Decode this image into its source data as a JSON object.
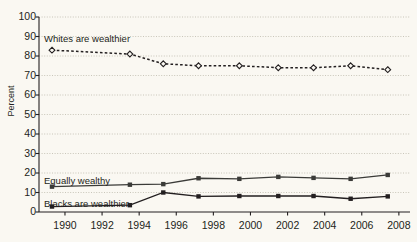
{
  "chart_data": {
    "type": "line",
    "title": "",
    "xlabel": "",
    "ylabel": "Percent",
    "xlim": [
      1988.6,
      2008.6
    ],
    "ylim": [
      0,
      100
    ],
    "grid": true,
    "legend_position": "inline-annotations",
    "yticks": [
      0,
      10,
      20,
      30,
      40,
      50,
      60,
      70,
      80,
      90,
      100
    ],
    "xticks": [
      1990,
      1992,
      1994,
      1996,
      1998,
      2000,
      2002,
      2004,
      2006,
      2008
    ],
    "ytick_labels": [
      "0",
      "10",
      "20",
      "30",
      "40",
      "50",
      "60",
      "70",
      "80",
      "90",
      "100"
    ],
    "xtick_labels": [
      "1990",
      "1992",
      "1994",
      "1996",
      "1998",
      "2000",
      "2002",
      "2004",
      "2006",
      "2008"
    ],
    "series": [
      {
        "name": "Whites are wealthier",
        "marker": "open-diamond",
        "linestyle": "dashed",
        "color": "#231f20",
        "x": [
          1989.3,
          1993.5,
          1995.3,
          1997.2,
          1999.4,
          2001.5,
          2003.4,
          2005.4,
          2007.4
        ],
        "values": [
          83,
          81,
          76,
          75,
          75,
          74,
          74,
          75,
          73
        ]
      },
      {
        "name": "Equally wealthy",
        "marker": "filled-square",
        "linestyle": "solid",
        "color": "#3b3b38",
        "x": [
          1989.3,
          1993.5,
          1995.3,
          1997.2,
          1999.4,
          2001.5,
          2003.4,
          2005.4,
          2007.4
        ],
        "values": [
          13,
          14,
          14.3,
          17.3,
          17,
          18,
          17.5,
          17,
          19
        ]
      },
      {
        "name": "Blacks are wealthier",
        "marker": "filled-square",
        "linestyle": "solid",
        "color": "#231f20",
        "x": [
          1989.3,
          1993.5,
          1995.3,
          1997.2,
          1999.4,
          2001.5,
          2003.4,
          2005.4,
          2007.4
        ],
        "values": [
          2.8,
          3.5,
          10,
          8,
          8.2,
          8.2,
          8.2,
          6.8,
          8
        ]
      }
    ],
    "annotations": [
      {
        "text": "Whites are wealthier",
        "x_px": 44,
        "y_px": 33
      },
      {
        "text": "Equally wealthy",
        "x_px": 44,
        "y_px": 175
      },
      {
        "text": "Blacks are wealthier",
        "x_px": 44,
        "y_px": 198
      }
    ]
  }
}
